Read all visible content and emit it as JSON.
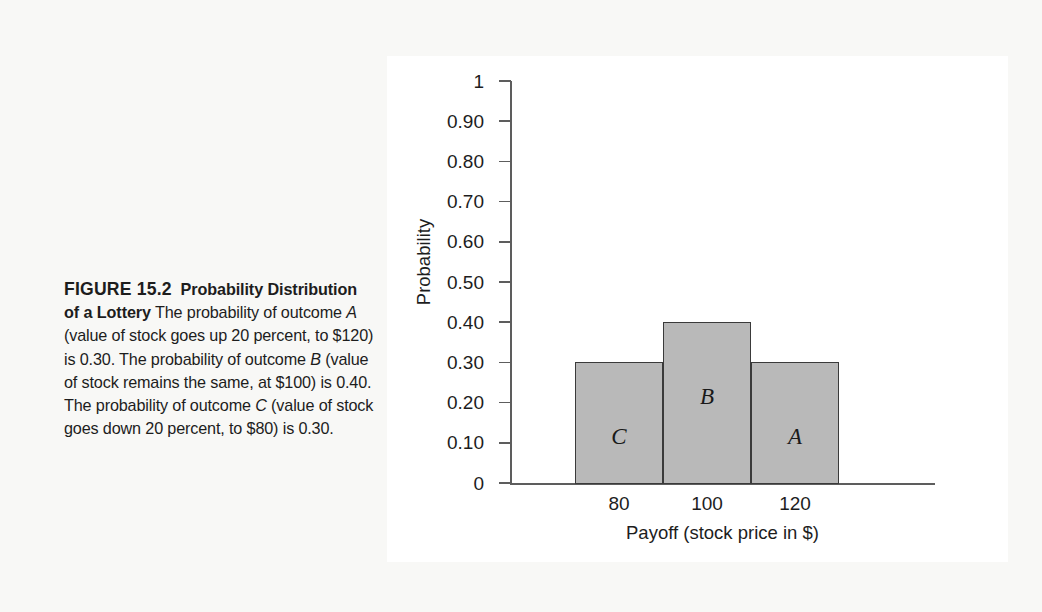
{
  "figure": {
    "number_label": "FIGURE 15.2",
    "title": "Probability Distribution of a Lottery",
    "body_parts": {
      "p1": "The probability of outcome ",
      "a1": "A",
      "p2": " (value of stock goes up 20 percent, to $120) is 0.30. The probability of outcome ",
      "b1": "B",
      "p3": " (value of stock remains the same, at $100) is 0.40. The probability of outcome ",
      "c1": "C",
      "p4": " (value of stock goes down 20 percent, to $80) is 0.30."
    }
  },
  "chart_data": {
    "type": "bar",
    "title": "",
    "xlabel": "Payoff (stock price in $)",
    "ylabel": "Probability",
    "categories": [
      "80",
      "100",
      "120"
    ],
    "values": [
      0.3,
      0.4,
      0.3
    ],
    "bar_labels": [
      "C",
      "B",
      "A"
    ],
    "ylim": [
      0,
      1
    ],
    "yticks": [
      0,
      0.1,
      0.2,
      0.3,
      0.4,
      0.5,
      0.6,
      0.7,
      0.8,
      0.9,
      1
    ],
    "ytick_labels": [
      "0",
      "0.10",
      "0.20",
      "0.30",
      "0.40",
      "0.50",
      "0.60",
      "0.70",
      "0.80",
      "0.90",
      "1"
    ],
    "grid": false,
    "legend": "none",
    "bar_fill_color": "#b9b9b9",
    "bar_edge_color": "#3a3a3a",
    "axis_color": "#5d5d5d",
    "panel_background": "#ffffff",
    "page_background": "#f8f8f6"
  }
}
